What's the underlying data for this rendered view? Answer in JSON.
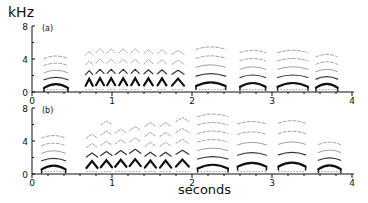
{
  "chart_data": [
    {
      "type": "heatmap",
      "subtype": "spectrogram",
      "panel_label": "(a)",
      "title": "",
      "ylabel": "kHz",
      "xlabel": "seconds",
      "ylim": [
        0,
        8
      ],
      "xlim": [
        0,
        4
      ],
      "yticks": [
        0,
        4,
        8
      ],
      "xticks": [
        0,
        1,
        2,
        3,
        4
      ],
      "grid": false,
      "syllables": [
        {
          "start": 0.15,
          "end": 0.45,
          "f0_khz": 1.2,
          "harmonics": 5,
          "max_khz": 4.3
        },
        {
          "start": 0.67,
          "end": 0.76,
          "f0_khz": 1.2,
          "harmonics": 4,
          "max_khz": 4.7
        },
        {
          "start": 0.8,
          "end": 0.9,
          "f0_khz": 1.2,
          "harmonics": 4,
          "max_khz": 5.0
        },
        {
          "start": 0.94,
          "end": 1.04,
          "f0_khz": 1.2,
          "harmonics": 4,
          "max_khz": 5.0
        },
        {
          "start": 1.09,
          "end": 1.19,
          "f0_khz": 1.2,
          "harmonics": 4,
          "max_khz": 5.0
        },
        {
          "start": 1.24,
          "end": 1.34,
          "f0_khz": 1.2,
          "harmonics": 4,
          "max_khz": 5.0
        },
        {
          "start": 1.4,
          "end": 1.51,
          "f0_khz": 1.2,
          "harmonics": 4,
          "max_khz": 4.9
        },
        {
          "start": 1.57,
          "end": 1.68,
          "f0_khz": 1.2,
          "harmonics": 4,
          "max_khz": 4.9
        },
        {
          "start": 1.75,
          "end": 1.9,
          "f0_khz": 1.3,
          "harmonics": 4,
          "max_khz": 4.8
        },
        {
          "start": 2.05,
          "end": 2.42,
          "f0_khz": 1.4,
          "harmonics": 5,
          "max_khz": 5.4
        },
        {
          "start": 2.6,
          "end": 2.92,
          "f0_khz": 1.4,
          "harmonics": 5,
          "max_khz": 5.0
        },
        {
          "start": 3.07,
          "end": 3.45,
          "f0_khz": 1.4,
          "harmonics": 5,
          "max_khz": 5.0
        },
        {
          "start": 3.55,
          "end": 3.82,
          "f0_khz": 1.3,
          "harmonics": 5,
          "max_khz": 4.5
        }
      ]
    },
    {
      "type": "heatmap",
      "subtype": "spectrogram",
      "panel_label": "(b)",
      "title": "",
      "ylabel": "kHz",
      "xlabel": "seconds",
      "ylim": [
        0,
        8
      ],
      "xlim": [
        0,
        4
      ],
      "yticks": [
        0,
        4,
        8
      ],
      "xticks": [
        0,
        1,
        2,
        3,
        4
      ],
      "grid": false,
      "syllables": [
        {
          "start": 0.12,
          "end": 0.42,
          "f0_khz": 1.5,
          "harmonics": 5,
          "max_khz": 4.6
        },
        {
          "start": 0.68,
          "end": 0.82,
          "f0_khz": 1.5,
          "harmonics": 4,
          "max_khz": 4.6
        },
        {
          "start": 0.86,
          "end": 1.0,
          "f0_khz": 1.5,
          "harmonics": 5,
          "max_khz": 6.2
        },
        {
          "start": 1.04,
          "end": 1.18,
          "f0_khz": 1.5,
          "harmonics": 4,
          "max_khz": 5.2
        },
        {
          "start": 1.22,
          "end": 1.36,
          "f0_khz": 1.5,
          "harmonics": 4,
          "max_khz": 5.5
        },
        {
          "start": 1.41,
          "end": 1.55,
          "f0_khz": 1.5,
          "harmonics": 5,
          "max_khz": 6.0
        },
        {
          "start": 1.6,
          "end": 1.74,
          "f0_khz": 1.5,
          "harmonics": 5,
          "max_khz": 6.0
        },
        {
          "start": 1.8,
          "end": 1.96,
          "f0_khz": 1.6,
          "harmonics": 5,
          "max_khz": 6.6
        },
        {
          "start": 2.07,
          "end": 2.45,
          "f0_khz": 1.6,
          "harmonics": 7,
          "max_khz": 7.2
        },
        {
          "start": 2.57,
          "end": 2.93,
          "f0_khz": 1.6,
          "harmonics": 5,
          "max_khz": 6.3
        },
        {
          "start": 3.08,
          "end": 3.42,
          "f0_khz": 1.5,
          "harmonics": 5,
          "max_khz": 6.4
        },
        {
          "start": 3.58,
          "end": 3.86,
          "f0_khz": 1.3,
          "harmonics": 4,
          "max_khz": 3.8
        }
      ]
    }
  ],
  "labels": {
    "unit": "kHz",
    "xlabel": "seconds",
    "panel_a": "(a)",
    "panel_b": "(b)",
    "yticks": [
      "0",
      "4",
      "8"
    ],
    "xticks": [
      "0",
      "1",
      "2",
      "3",
      "4"
    ]
  },
  "colors": {
    "ink": "#111111",
    "faint": "#888888",
    "background": "#ffffff"
  }
}
